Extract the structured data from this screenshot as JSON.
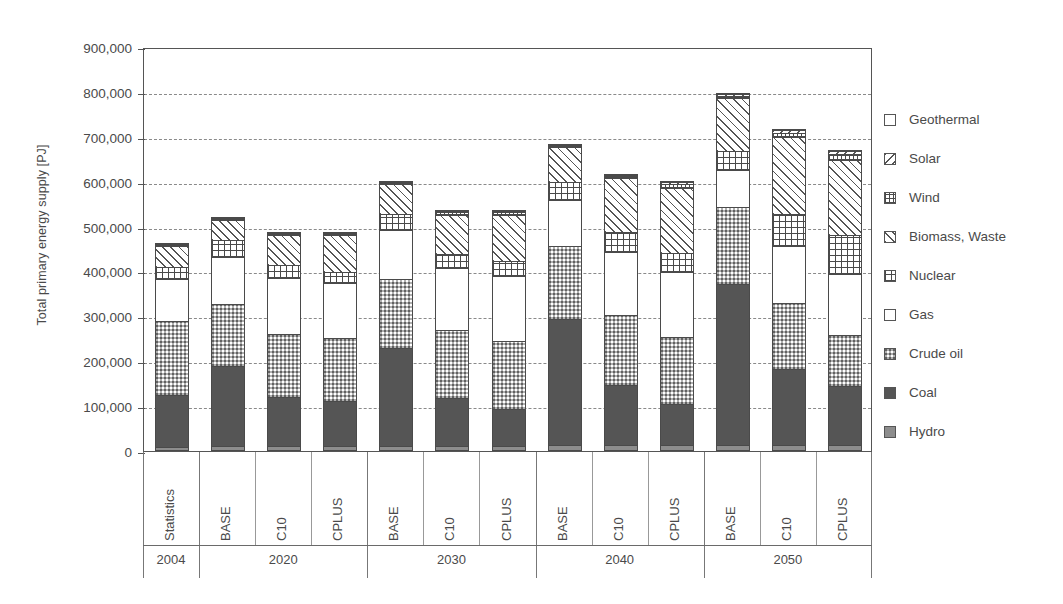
{
  "chart_data": {
    "type": "bar",
    "subtype": "stacked-bar",
    "title": "",
    "xlabel": "",
    "ylabel": "Total primary energy supply [PJ]",
    "ylim": [
      0,
      900000
    ],
    "ytick_labels": [
      "0",
      "100,000",
      "200,000",
      "300,000",
      "400,000",
      "500,000",
      "600,000",
      "700,000",
      "800,000",
      "900,000"
    ],
    "ytick_values": [
      0,
      100000,
      200000,
      300000,
      400000,
      500000,
      600000,
      700000,
      800000,
      900000
    ],
    "grid": true,
    "legend_position": "right",
    "categories": [
      "Statistics",
      "BASE",
      "C10",
      "CPLUS",
      "BASE",
      "C10",
      "CPLUS",
      "BASE",
      "C10",
      "CPLUS",
      "BASE",
      "C10",
      "CPLUS"
    ],
    "group_labels": [
      "2004",
      "2020",
      "2030",
      "2040",
      "2050"
    ],
    "group_sizes": [
      1,
      3,
      3,
      3,
      3
    ],
    "series": [
      {
        "name": "Hydro",
        "pattern": "solid-gray",
        "values": [
          10000,
          11000,
          11000,
          11000,
          12000,
          12000,
          12000,
          13000,
          13000,
          13000,
          14000,
          14000,
          14000
        ]
      },
      {
        "name": "Coal",
        "pattern": "solid-dark",
        "values": [
          118000,
          180000,
          112000,
          103000,
          220000,
          108000,
          83000,
          283000,
          137000,
          95000,
          360000,
          170000,
          132000
        ]
      },
      {
        "name": "Crude oil",
        "pattern": "checker",
        "values": [
          165000,
          142000,
          142000,
          142000,
          155000,
          153000,
          155000,
          165000,
          158000,
          150000,
          175000,
          150000,
          118000
        ]
      },
      {
        "name": "Gas",
        "pattern": "empty",
        "values": [
          98000,
          105000,
          128000,
          125000,
          112000,
          142000,
          147000,
          105000,
          143000,
          147000,
          83000,
          130000,
          138000
        ]
      },
      {
        "name": "Nuclear",
        "pattern": "grid",
        "values": [
          27000,
          40000,
          30000,
          27000,
          37000,
          33000,
          35000,
          42000,
          45000,
          45000,
          45000,
          72000,
          88000
        ]
      },
      {
        "name": "Biomass, Waste",
        "pattern": "diag-forward",
        "values": [
          50000,
          48000,
          70000,
          85000,
          70000,
          90000,
          105000,
          80000,
          123000,
          148000,
          120000,
          175000,
          170000
        ]
      },
      {
        "name": "Wind",
        "pattern": "grid-fine",
        "values": [
          2000,
          4000,
          5000,
          5000,
          5000,
          7000,
          8000,
          5000,
          8000,
          10000,
          8000,
          12000,
          14000
        ]
      },
      {
        "name": "Solar",
        "pattern": "diag-back",
        "values": [
          500,
          1500,
          2000,
          2000,
          2000,
          3000,
          4000,
          3000,
          4000,
          6000,
          5000,
          8000,
          10000
        ]
      },
      {
        "name": "Geothermal",
        "pattern": "empty",
        "values": [
          500,
          500,
          500,
          500,
          600,
          600,
          600,
          700,
          700,
          700,
          800,
          800,
          800
        ]
      }
    ],
    "totals": [
      471000,
      532000,
      500500,
      500500,
      613600,
      548600,
      549600,
      696700,
      631700,
      614700,
      810800,
      731800,
      684800
    ]
  },
  "legend": {
    "items": [
      {
        "label": "Geothermal",
        "pattern": "empty"
      },
      {
        "label": "Solar",
        "pattern": "diag-back"
      },
      {
        "label": "Wind",
        "pattern": "grid-fine"
      },
      {
        "label": "Biomass, Waste",
        "pattern": "diag-forward"
      },
      {
        "label": "Nuclear",
        "pattern": "grid"
      },
      {
        "label": "Gas",
        "pattern": "empty"
      },
      {
        "label": "Crude oil",
        "pattern": "checker"
      },
      {
        "label": "Coal",
        "pattern": "solid-dark"
      },
      {
        "label": "Hydro",
        "pattern": "solid-gray"
      }
    ]
  },
  "colors": {
    "axis": "#555555",
    "grid": "#8a8a8a",
    "text": "#4a4a4a",
    "coal": "#555555",
    "hydro": "#8d8d8d",
    "background": "#ffffff"
  }
}
